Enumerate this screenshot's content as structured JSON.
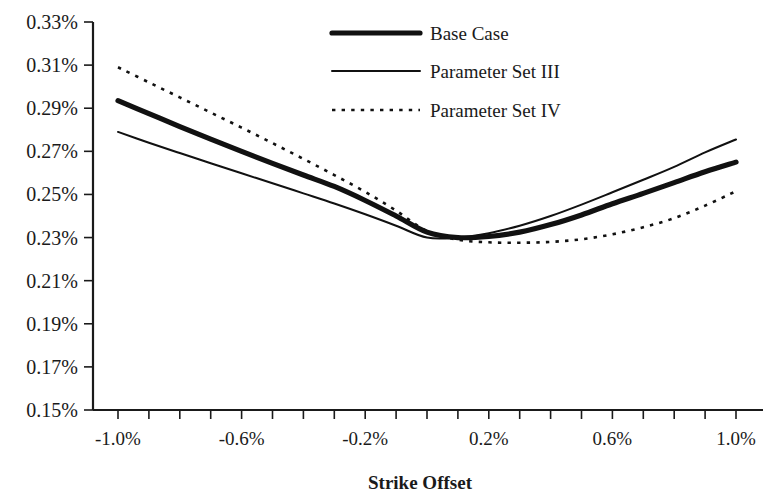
{
  "chart_data": {
    "type": "line",
    "title": "",
    "xlabel": "Strike Offset",
    "ylabel": "",
    "xlim": [
      -1.0,
      1.0
    ],
    "ylim": [
      0.15,
      0.33
    ],
    "grid": false,
    "legend_position": "top-center",
    "x_tick_labels": [
      "-1.0%",
      "-0.6%",
      "-0.2%",
      "0.2%",
      "0.6%",
      "1.0%"
    ],
    "x_tick_values": [
      -1.0,
      -0.6,
      -0.2,
      0.2,
      0.6,
      1.0
    ],
    "x_minor_tick_step": 0.1,
    "y_tick_labels": [
      "0.33%",
      "0.31%",
      "0.29%",
      "0.27%",
      "0.25%",
      "0.23%",
      "0.21%",
      "0.19%",
      "0.17%",
      "0.15%"
    ],
    "y_tick_values": [
      0.33,
      0.31,
      0.29,
      0.27,
      0.25,
      0.23,
      0.21,
      0.19,
      0.17,
      0.15
    ],
    "x": [
      -1.0,
      -0.9,
      -0.8,
      -0.7,
      -0.6,
      -0.5,
      -0.4,
      -0.3,
      -0.2,
      -0.1,
      0.0,
      0.1,
      0.2,
      0.3,
      0.4,
      0.5,
      0.6,
      0.7,
      0.8,
      0.9,
      1.0
    ],
    "series": [
      {
        "name": "Base Case",
        "style": "thick-solid",
        "color": "#111111",
        "values": [
          0.2935,
          0.2875,
          0.2815,
          0.2757,
          0.27,
          0.2644,
          0.259,
          0.2537,
          0.2472,
          0.24,
          0.2325,
          0.23,
          0.2305,
          0.2325,
          0.236,
          0.2405,
          0.2457,
          0.2505,
          0.2555,
          0.2605,
          0.265
        ]
      },
      {
        "name": "Parameter Set III",
        "style": "thin-solid",
        "color": "#111111",
        "values": [
          0.279,
          0.274,
          0.2692,
          0.2645,
          0.2598,
          0.2552,
          0.2505,
          0.2458,
          0.2408,
          0.2355,
          0.23,
          0.23,
          0.232,
          0.2355,
          0.24,
          0.2453,
          0.251,
          0.2568,
          0.2628,
          0.2695,
          0.2755
        ]
      },
      {
        "name": "Parameter Set IV",
        "style": "dotted",
        "color": "#111111",
        "values": [
          0.309,
          0.302,
          0.295,
          0.288,
          0.281,
          0.2738,
          0.2665,
          0.259,
          0.2512,
          0.2425,
          0.233,
          0.229,
          0.2278,
          0.2276,
          0.228,
          0.2292,
          0.2315,
          0.2348,
          0.239,
          0.2448,
          0.2515
        ]
      }
    ]
  },
  "legend": {
    "items": [
      {
        "label": "Base Case"
      },
      {
        "label": "Parameter Set III"
      },
      {
        "label": "Parameter Set IV"
      }
    ]
  }
}
